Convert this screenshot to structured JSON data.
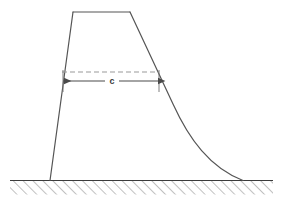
{
  "figure": {
    "background_color": "#ffffff",
    "outline_color": "#555555",
    "dashed_color": "#9a9a9a",
    "arrow_color": "#4a4a4a",
    "ground_line_color": "#3c3c3c",
    "hatch_color": "#8d8d8d",
    "dimension": {
      "label": "c",
      "label_x": 112,
      "label_y": 81
    },
    "geometry": {
      "crest_top_left": [
        73,
        12
      ],
      "crest_top_right": [
        130,
        12
      ],
      "heel_bottom_left": [
        50,
        180
      ],
      "toe_bottom_right": [
        243,
        180
      ],
      "right_face_straight_end": [
        173,
        104
      ],
      "ground_line_y": 180,
      "ground_line_x_start": 10,
      "ground_line_x_end": 273,
      "hatch_depth": 14,
      "dashed_line_y": 72,
      "dashed_line_x_start": 62,
      "dashed_line_x_end": 159,
      "arrow_line_y": 81,
      "arrow_line_x_start": 63,
      "arrow_line_x_end": 159,
      "tick_left_x": 63,
      "tick_right_x": 159,
      "tick_top_y": 70,
      "tick_bottom_y": 92
    }
  }
}
